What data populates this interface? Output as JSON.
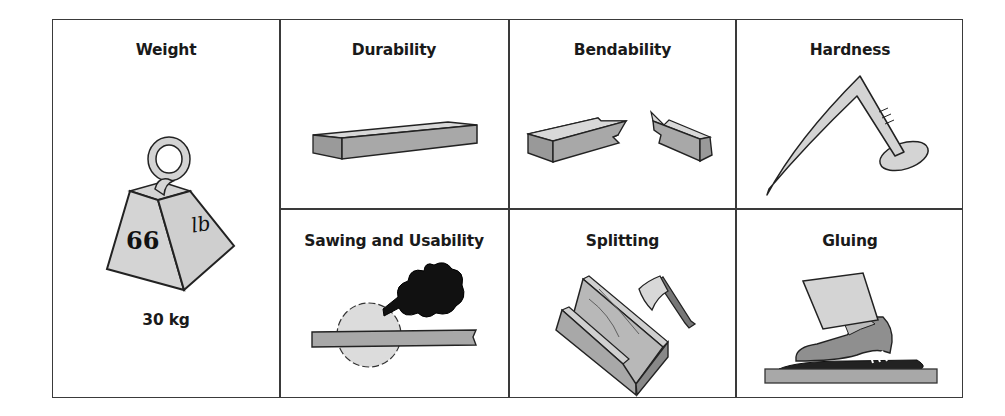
{
  "diagram": {
    "cells": {
      "weight": {
        "label": "Weight",
        "weight_text_1": "66",
        "weight_text_2": "lb",
        "caption": "30 kg",
        "icon": "weight-icon"
      },
      "durability": {
        "label": "Durability",
        "icon": "plank-icon"
      },
      "bendability": {
        "label": "Bendability",
        "icon": "broken-plank-icon"
      },
      "hardness": {
        "label": "Hardness",
        "icon": "bent-nail-icon"
      },
      "sawing": {
        "label": "Sawing and Usability",
        "icon": "circular-saw-smoke-icon"
      },
      "splitting": {
        "label": "Splitting",
        "icon": "split-wood-axe-icon"
      },
      "gluing": {
        "label": "Gluing",
        "icon": "shoe-glue-icon"
      }
    },
    "colors": {
      "border": "#3a3a3a",
      "fill_light": "#d4d4d4",
      "fill_mid": "#a9a9a9",
      "fill_dark": "#1a1a1a"
    }
  }
}
